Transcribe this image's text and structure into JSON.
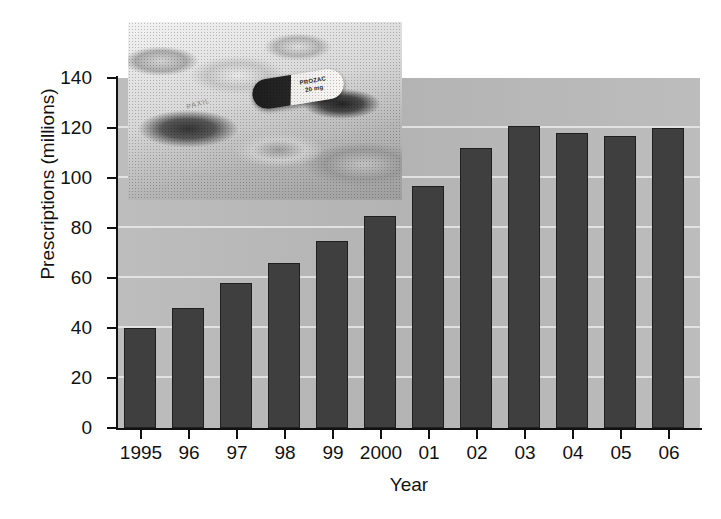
{
  "chart_data": {
    "type": "bar",
    "title": "",
    "xlabel": "Year",
    "ylabel": "Prescriptions (millions)",
    "categories": [
      "1995",
      "96",
      "97",
      "98",
      "99",
      "2000",
      "01",
      "02",
      "03",
      "04",
      "05",
      "06"
    ],
    "values": [
      40,
      48,
      58,
      66,
      75,
      85,
      97,
      112,
      121,
      118,
      117,
      120
    ],
    "ylim": [
      0,
      140
    ],
    "yticks": [
      0,
      20,
      40,
      60,
      80,
      100,
      120,
      140
    ],
    "ytick_labels": [
      "0",
      "20",
      "40",
      "60",
      "80",
      "100",
      "120",
      "140"
    ],
    "grid": true,
    "grid_axis": "y",
    "legend": null,
    "legend_position": "none",
    "series": [
      {
        "name": "Prescriptions",
        "values": [
          40,
          48,
          58,
          66,
          75,
          85,
          97,
          112,
          121,
          118,
          117,
          120
        ]
      }
    ]
  },
  "colors": {
    "bar_fill": "#3f3f3f",
    "bar_border": "#1f1f1f",
    "plot_background": "#b9b9b9",
    "gridline": "#e9e9e9",
    "axis": "#111111",
    "page_background": "#ffffff",
    "text": "#111111"
  },
  "inset_photo": {
    "name": "prozac-pills-photograph",
    "description": "Black and white close-up photograph of assorted tablets and capsules",
    "capsule_label_line1": "PROZAC",
    "capsule_label_line2": "20 mg",
    "tablet_imprint": "PAXIL"
  },
  "caption": {
    "remnant": ""
  }
}
